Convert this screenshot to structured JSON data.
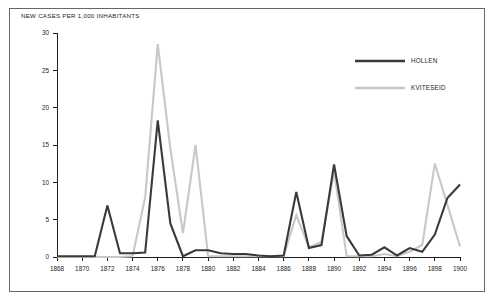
{
  "figure": {
    "title": "NEW CASES PER 1,000 INHABITANTS",
    "border_color": "#666666",
    "background": "#ffffff"
  },
  "legend": {
    "position": "top-right",
    "entries": [
      {
        "label": "HOLLEN",
        "color": "#3a3a3a"
      },
      {
        "label": "KVITESEID",
        "color": "#c8c8c8"
      }
    ]
  },
  "axes": {
    "y_ticks": [
      "0",
      "5",
      "10",
      "15",
      "20",
      "25",
      "30"
    ],
    "x_ticks": [
      "1868",
      "1870",
      "1872",
      "1874",
      "1876",
      "1878",
      "1880",
      "1882",
      "1884",
      "1886",
      "1888",
      "1890",
      "1892",
      "1894",
      "1896",
      "1898",
      "1900"
    ]
  },
  "chart_data": {
    "type": "line",
    "title": "NEW CASES PER 1,000 INHABITANTS",
    "xlabel": "",
    "ylabel": "",
    "xlim": [
      1868,
      1900
    ],
    "ylim": [
      0,
      30
    ],
    "ytick_step": 5,
    "xtick_step": 2,
    "grid": false,
    "legend_position": "top-right",
    "x": [
      1868,
      1869,
      1870,
      1871,
      1872,
      1873,
      1874,
      1875,
      1876,
      1877,
      1878,
      1879,
      1880,
      1881,
      1882,
      1883,
      1884,
      1885,
      1886,
      1887,
      1888,
      1889,
      1890,
      1891,
      1892,
      1893,
      1894,
      1895,
      1896,
      1897,
      1898,
      1899,
      1900
    ],
    "series": [
      {
        "name": "HOLLEN",
        "color": "#3a3a3a",
        "values": [
          0.1,
          0.1,
          0.1,
          0.1,
          6.9,
          0.5,
          0.5,
          0.6,
          18.3,
          4.5,
          0.1,
          0.9,
          0.9,
          0.5,
          0.4,
          0.4,
          0.2,
          0.1,
          0.2,
          8.7,
          1.2,
          1.6,
          12.4,
          2.8,
          0.2,
          0.3,
          1.3,
          0.2,
          1.2,
          0.7,
          3.0,
          7.9,
          9.7
        ]
      },
      {
        "name": "KVITESEID",
        "color": "#c8c8c8",
        "values": [
          0.0,
          0.0,
          0.0,
          0.0,
          0.0,
          0.0,
          0.1,
          8.0,
          28.5,
          14.5,
          3.2,
          15.0,
          0.1,
          0.1,
          0.1,
          0.1,
          0.1,
          0.1,
          0.1,
          5.6,
          1.3,
          2.0,
          11.5,
          0.1,
          0.1,
          0.1,
          0.4,
          0.1,
          0.7,
          1.6,
          12.5,
          7.0,
          1.4
        ]
      }
    ]
  }
}
